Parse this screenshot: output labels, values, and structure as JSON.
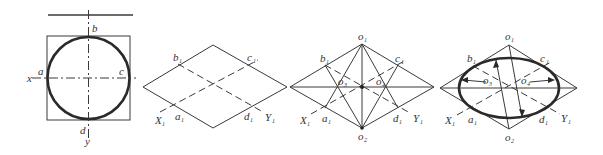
{
  "diagram": {
    "panels": [
      {
        "id": "step1-circle",
        "labels": {
          "b": "b",
          "a": "a",
          "c": "c",
          "d": "d",
          "x": "x",
          "y": "y"
        }
      },
      {
        "id": "step2-rhombus",
        "labels": {
          "b": "b",
          "c": "c",
          "a": "a",
          "d": "d",
          "sub": "1",
          "X": "X",
          "Y": "Y"
        }
      },
      {
        "id": "step3-centers",
        "labels": {
          "o1": "o",
          "o2": "o",
          "o3": "o",
          "o4": "o",
          "b": "b",
          "c": "c",
          "a": "a",
          "d": "d",
          "X": "X",
          "Y": "Y",
          "sub1": "1",
          "sub2": "2",
          "sub3": "3",
          "sub4": "4"
        }
      },
      {
        "id": "step4-ellipse",
        "labels": {
          "o1": "o",
          "o2": "o",
          "o3": "o",
          "o4": "o",
          "b": "b",
          "c": "c",
          "a": "a",
          "d": "d",
          "X": "X",
          "Y": "Y",
          "sub1": "1",
          "sub2": "2",
          "sub3": "3",
          "sub4": "4"
        }
      }
    ]
  }
}
